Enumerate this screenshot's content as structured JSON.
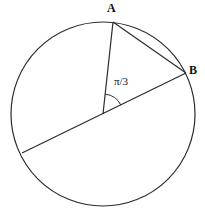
{
  "figure": {
    "type": "circle-geometry-diagram",
    "background_color": "#ffffff",
    "stroke_color": "#2b2b2b",
    "text_color": "#111111",
    "circle": {
      "name": "main-circle",
      "center_x": 103,
      "center_y": 114,
      "radius": 92,
      "stroke_width": 1.2
    },
    "points": [
      {
        "id": "A",
        "label": "A",
        "x": 113,
        "y": 22,
        "on_circle": true
      },
      {
        "id": "B",
        "label": "B",
        "x": 186,
        "y": 73,
        "on_circle": true
      },
      {
        "id": "O",
        "label": "",
        "x": 103,
        "y": 114,
        "on_circle": false
      },
      {
        "id": "C",
        "label": "",
        "x": 22,
        "y": 153,
        "on_circle": true
      }
    ],
    "segments": [
      {
        "id": "radius-OA",
        "from": "O",
        "to": "A",
        "kind": "radius"
      },
      {
        "id": "chord-AB",
        "from": "A",
        "to": "B",
        "kind": "chord"
      },
      {
        "id": "diameter-BC",
        "from": "B",
        "to": "C",
        "kind": "diameter"
      }
    ],
    "angle_marker": {
      "id": "central-angle",
      "label": "π/3",
      "vertex": "O",
      "from_point": "A",
      "to_point": "B",
      "arc_radius": 20,
      "label_x": 114,
      "label_y": 76
    },
    "labels": {
      "point_a": "A",
      "point_b": "B",
      "angle": "π/3"
    }
  }
}
